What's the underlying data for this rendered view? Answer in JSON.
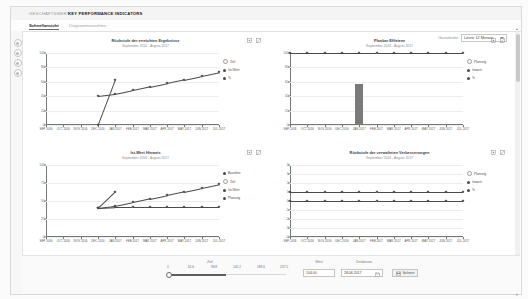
{
  "header": {
    "breadcrumb_parent": "GESCHÄFTSWERT",
    "breadcrumb_current": "KEY PERFORMANCE INDICATORS"
  },
  "tabs": [
    {
      "label": "Schnellansicht",
      "active": true
    },
    {
      "label": "Diagrammansichten",
      "active": false
    }
  ],
  "rail": {
    "items": [
      {
        "name": "info-icon"
      },
      {
        "name": "edit-icon"
      },
      {
        "name": "filter-icon"
      },
      {
        "name": "settings-icon"
      }
    ]
  },
  "granularity": {
    "label": "Granularität",
    "value": "Letzte 12 Monate",
    "options": [
      "Letzte 12 Monate",
      "Letzte 6 Monate",
      "Letzte 24 Monate"
    ]
  },
  "chart_data": [
    {
      "type": "line",
      "title": "Rückstufe der erreichten Ergebnisse",
      "subtitle": "September 2016 - August 2017",
      "xlabel": "",
      "ylabel": "",
      "ylim": [
        0,
        100
      ],
      "yticks": [
        0,
        20,
        40,
        60,
        80,
        100
      ],
      "categories": [
        "SEP 2016",
        "OCT 2016",
        "NOV 2016",
        "DEC 2016",
        "JAN 2017",
        "FEB 2017",
        "MAR 2017",
        "APR 2017",
        "MAY 2017",
        "JUN 2017",
        "JUL 2017"
      ],
      "series": [
        {
          "name": "Ziel",
          "values": [
            null,
            null,
            null,
            40,
            43,
            48,
            53,
            58,
            63,
            68,
            73
          ]
        },
        {
          "name": "Ist-Wert",
          "values": [
            null,
            null,
            null,
            0,
            63,
            null,
            null,
            null,
            null,
            null,
            null
          ]
        },
        {
          "name": "%",
          "values": []
        }
      ],
      "legend": [
        {
          "label": "Ziel",
          "style": "hollow",
          "color": "#ffffff"
        },
        {
          "label": "Ist-Wert",
          "style": "solid",
          "color": "#4a4a4a"
        },
        {
          "label": "%",
          "style": "solid",
          "color": "#4a4a4a"
        }
      ]
    },
    {
      "type": "bar",
      "title": "Planbar Effizienz",
      "subtitle": "September 2016 - August 2017",
      "xlabel": "",
      "ylabel": "",
      "ylim": [
        0,
        100
      ],
      "yticks": [
        0,
        20,
        40,
        60,
        80,
        100
      ],
      "categories": [
        "SEP 2016",
        "OCT 2016",
        "NOV 2016",
        "DEC 2016",
        "JAN 2017",
        "FEB 2017",
        "MAR 2017",
        "APR 2017",
        "MAY 2017",
        "JUN 2017",
        "JUL 2017"
      ],
      "series": [
        {
          "name": "Planung",
          "values": [
            100,
            100,
            100,
            100,
            100,
            100,
            100,
            100,
            100,
            100,
            100
          ]
        },
        {
          "name": "Istwert",
          "values": [
            0,
            0,
            0,
            0,
            57,
            0,
            0,
            0,
            0,
            0,
            0
          ]
        },
        {
          "name": "%",
          "values": []
        }
      ],
      "legend": [
        {
          "label": "Planung",
          "style": "hollow",
          "color": "#ffffff"
        },
        {
          "label": "Istwert",
          "style": "solid",
          "color": "#4a4a4a"
        },
        {
          "label": "%",
          "style": "solid",
          "color": "#4a4a4a"
        }
      ]
    },
    {
      "type": "line",
      "title": "Ist-Wert Hinweis",
      "subtitle": "September 2016 - August 2017",
      "xlabel": "",
      "ylabel": "",
      "ylim": [
        0,
        100
      ],
      "yticks": [
        0,
        25,
        50,
        75,
        100
      ],
      "categories": [
        "SEP 2016",
        "OCT 2016",
        "NOV 2016",
        "DEC 2016",
        "JAN 2017",
        "FEB 2017",
        "MAR 2017",
        "APR 2017",
        "MAY 2017",
        "JUN 2017",
        "JUL 2017"
      ],
      "series": [
        {
          "name": "Baseline",
          "values": [
            null,
            null,
            null,
            40,
            41,
            41,
            41,
            41,
            41,
            41,
            41
          ]
        },
        {
          "name": "Ziel",
          "values": [
            null,
            null,
            null,
            40,
            43,
            48,
            53,
            58,
            63,
            68,
            73
          ]
        },
        {
          "name": "Ist-Wert",
          "values": [
            null,
            null,
            null,
            40,
            63,
            null,
            null,
            null,
            null,
            null,
            null
          ]
        },
        {
          "name": "Planung",
          "values": []
        }
      ],
      "legend": [
        {
          "label": "Baseline",
          "style": "solid",
          "color": "#4a4a4a"
        },
        {
          "label": "Ziel",
          "style": "hollow",
          "color": "#ffffff"
        },
        {
          "label": "Ist-Wert",
          "style": "solid",
          "color": "#4a4a4a"
        },
        {
          "label": "Planung",
          "style": "solid",
          "color": "#4a4a4a"
        }
      ]
    },
    {
      "type": "line",
      "title": "Rückstufe der verwalteten Verbesserungen",
      "subtitle": "September 2016 - August 2017",
      "xlabel": "",
      "ylabel": "",
      "ylim": [
        -4,
        4
      ],
      "yticks": [
        -4,
        -3,
        -2,
        -1,
        0,
        1,
        2,
        3,
        4
      ],
      "categories": [
        "SEP 2016",
        "OCT 2016",
        "NOV 2016",
        "DEC 2016",
        "JAN 2017",
        "FEB 2017",
        "MAR 2017",
        "APR 2017",
        "MAY 2017",
        "JUN 2017",
        "JUL 2017"
      ],
      "series": [
        {
          "name": "Planung",
          "values": [
            1,
            1,
            1,
            1,
            1,
            1,
            1,
            1,
            1,
            1,
            1
          ]
        },
        {
          "name": "Istwert",
          "values": [
            0,
            0,
            0,
            0,
            0,
            0,
            0,
            0,
            0,
            0,
            0
          ]
        },
        {
          "name": "%",
          "values": []
        }
      ],
      "legend": [
        {
          "label": "Planung",
          "style": "hollow",
          "color": "#ffffff"
        },
        {
          "label": "Istwert",
          "style": "solid",
          "color": "#4a4a4a"
        },
        {
          "label": "%",
          "style": "solid",
          "color": "#4a4a4a"
        }
      ]
    }
  ],
  "footer": {
    "slider": {
      "label": "Ziel",
      "ticks": [
        "0",
        "61.6",
        "98.8",
        "142.2",
        "189.6",
        "237.5"
      ],
      "value": "98.8"
    },
    "value_field": {
      "label": "Wert",
      "value": "104.00"
    },
    "date_field": {
      "label": "Zeitdatum",
      "value": "28.06.2017"
    },
    "save_button": {
      "label": "Sichern"
    }
  },
  "colors": {
    "bar": "#7a7a7a",
    "line": "#4a4a4a",
    "grid": "#ededed",
    "axis": "#777777"
  }
}
